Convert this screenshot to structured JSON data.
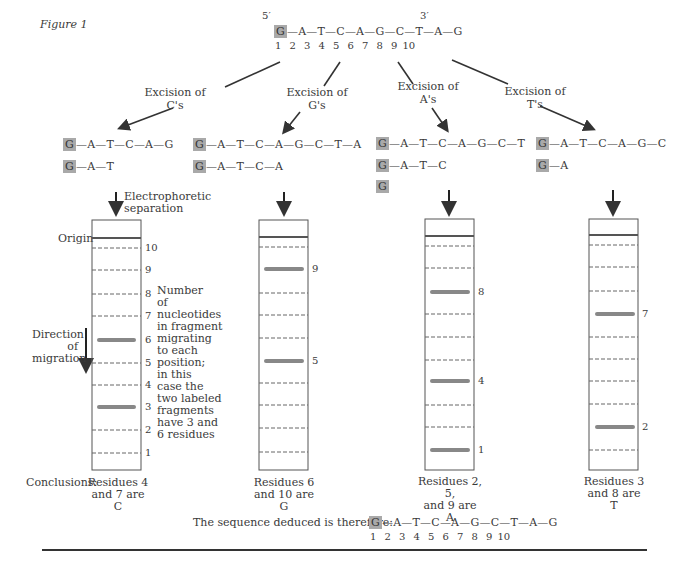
{
  "figure": {
    "title": "Figure 1",
    "original": {
      "five_prime": "5′",
      "three_prime": "3′",
      "labeled_residue": "G",
      "sequence_rest": "—A—T—C—A—G—C—T—A—G",
      "positions": [
        "1",
        "2",
        "3",
        "4",
        "5",
        "6",
        "7",
        "8",
        "9",
        "10"
      ]
    },
    "excisions": [
      {
        "label_line1": "Excision of",
        "label_line2": "C's",
        "fragments": [
          {
            "labeled": "G",
            "rest": "—A—T—C—A—G"
          },
          {
            "labeled": "G",
            "rest": "—A—T"
          }
        ],
        "band_positions": [
          6,
          3
        ],
        "conclusion": [
          "Residues 4",
          "and 7 are",
          "C"
        ]
      },
      {
        "label_line1": "Excision of",
        "label_line2": "G's",
        "fragments": [
          {
            "labeled": "G",
            "rest": "—A—T—C—A—G—C—T—A"
          },
          {
            "labeled": "G",
            "rest": "—A—T—C—A"
          }
        ],
        "band_positions": [
          9,
          5
        ],
        "conclusion": [
          "Residues 6",
          "and 10 are",
          "G"
        ]
      },
      {
        "label_line1": "Excision of",
        "label_line2": "A's",
        "fragments": [
          {
            "labeled": "G",
            "rest": "—A—T—C—A—G—C—T"
          },
          {
            "labeled": "G",
            "rest": "—A—T—C"
          },
          {
            "labeled": "G",
            "rest": ""
          }
        ],
        "band_positions": [
          8,
          4,
          1
        ],
        "conclusion": [
          "Residues 2, 5,",
          "and 9 are",
          "A"
        ]
      },
      {
        "label_line1": "Excision of",
        "label_line2": "T's",
        "fragments": [
          {
            "labeled": "G",
            "rest": "—A—T—C—A—G—C"
          },
          {
            "labeled": "G",
            "rest": "—A"
          }
        ],
        "band_positions": [
          7,
          2
        ],
        "conclusion": [
          "Residues 3",
          "and 8 are",
          "T"
        ]
      }
    ],
    "electrophoresis_label": [
      "Electrophoretic",
      "separation"
    ],
    "origin_label": "Origin",
    "direction_label": [
      "Direction",
      "of",
      "migration"
    ],
    "scale_labels": [
      "10",
      "9",
      "8",
      "7",
      "6",
      "5",
      "4",
      "3",
      "2",
      "1"
    ],
    "note": [
      "Number",
      "of",
      "nucleotides",
      "in fragment",
      "migrating",
      "to each",
      "position;",
      "in this",
      "case the",
      "two labeled",
      "fragments",
      "have 3 and",
      "6 residues"
    ],
    "conclusions_label": "Conclusions:",
    "deduced": {
      "label": "The sequence deduced is therefore:",
      "labeled_residue": "G",
      "sequence_rest": "—A—T—C—A—G—C—T—A—G",
      "positions": [
        "1",
        "2",
        "3",
        "4",
        "5",
        "6",
        "7",
        "8",
        "9",
        "10"
      ]
    }
  }
}
